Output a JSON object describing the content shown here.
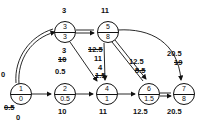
{
  "diagram": {
    "type": "network-flow-graph",
    "title": "",
    "nodes": [
      {
        "id": "n1",
        "top": "1",
        "bottom": "0",
        "x": 10,
        "y": 83
      },
      {
        "id": "n2",
        "top": "2",
        "bottom": "0.5",
        "x": 54,
        "y": 83
      },
      {
        "id": "n3",
        "top": "3",
        "bottom": "3",
        "x": 54,
        "y": 21
      },
      {
        "id": "n4",
        "top": "4",
        "bottom": "1",
        "x": 96,
        "y": 83
      },
      {
        "id": "n5",
        "top": "5",
        "bottom": "8",
        "x": 97,
        "y": 21
      },
      {
        "id": "n6",
        "top": "6",
        "bottom": "1.5",
        "x": 138,
        "y": 83
      },
      {
        "id": "n7",
        "top": "7",
        "bottom": "8",
        "x": 173,
        "y": 83
      }
    ],
    "labels": [
      {
        "id": "l-n1-left",
        "text": "0",
        "x": 1,
        "y": 71,
        "strike": false
      },
      {
        "id": "l-n1-below-strike",
        "text": "0.5",
        "x": 4,
        "y": 106,
        "strike": true
      },
      {
        "id": "l-n1-below",
        "text": "0",
        "x": 16,
        "y": 116,
        "strike": false
      },
      {
        "id": "l-n2-above",
        "text": "0.5",
        "x": 55,
        "y": 70,
        "strike": false
      },
      {
        "id": "l-n2-below",
        "text": "10",
        "x": 58,
        "y": 110,
        "strike": false
      },
      {
        "id": "l-n3-above",
        "text": "3",
        "x": 61,
        "y": 9,
        "strike": false
      },
      {
        "id": "l-n3-below",
        "text": "3",
        "x": 61,
        "y": 48,
        "strike": false
      },
      {
        "id": "l-n3-below-strike",
        "text": "10",
        "x": 57,
        "y": 58,
        "strike": true
      },
      {
        "id": "l-n5-above",
        "text": "11",
        "x": 100,
        "y": 9,
        "strike": false
      },
      {
        "id": "l-n5-below-strike",
        "text": "12.5",
        "x": 88,
        "y": 47,
        "strike": true
      },
      {
        "id": "l-n5-below",
        "text": "11",
        "x": 94,
        "y": 56,
        "strike": false
      },
      {
        "id": "l-n4-above",
        "text": "4",
        "x": 98,
        "y": 65,
        "strike": false
      },
      {
        "id": "l-n4-above-strike",
        "text": "1.5",
        "x": 95,
        "y": 73,
        "strike": true
      },
      {
        "id": "l-n4-below",
        "text": "11",
        "x": 98,
        "y": 110,
        "strike": false
      },
      {
        "id": "l-n6-above",
        "text": "12.5",
        "x": 129,
        "y": 59,
        "strike": false
      },
      {
        "id": "l-n6-above-strike",
        "text": "5.5",
        "x": 134,
        "y": 69,
        "strike": true
      },
      {
        "id": "l-n6-below",
        "text": "12.5",
        "x": 132,
        "y": 110,
        "strike": false
      },
      {
        "id": "l-n7-above",
        "text": "20.5",
        "x": 167,
        "y": 51,
        "strike": false
      },
      {
        "id": "l-n7-above-strike",
        "text": "19",
        "x": 173,
        "y": 60,
        "strike": true
      },
      {
        "id": "l-n7-below",
        "text": "20.5",
        "x": 166,
        "y": 110,
        "strike": false
      }
    ],
    "edges": [
      {
        "id": "e-1-3",
        "from": "n1",
        "to": "n3",
        "style": "double-curve"
      },
      {
        "id": "e-1-2",
        "from": "n1",
        "to": "n2",
        "style": "single"
      },
      {
        "id": "e-2-4",
        "from": "n2",
        "to": "n4",
        "style": "single"
      },
      {
        "id": "e-3-5",
        "from": "n3",
        "to": "n5",
        "style": "double"
      },
      {
        "id": "e-3-4",
        "from": "n3",
        "to": "n4",
        "style": "single"
      },
      {
        "id": "e-5-4",
        "from": "n5",
        "to": "n4",
        "style": "single"
      },
      {
        "id": "e-5-6",
        "from": "n5",
        "to": "n6",
        "style": "double"
      },
      {
        "id": "e-5-7",
        "from": "n5",
        "to": "n7",
        "style": "curve"
      },
      {
        "id": "e-4-6",
        "from": "n4",
        "to": "n6",
        "style": "single"
      },
      {
        "id": "e-6-7",
        "from": "n6",
        "to": "n7",
        "style": "double"
      }
    ]
  }
}
